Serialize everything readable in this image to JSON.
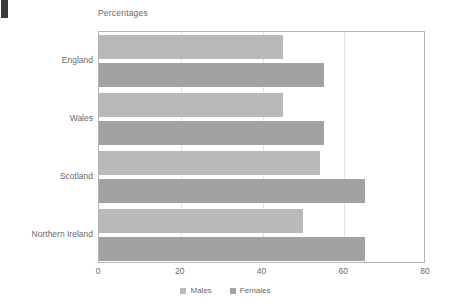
{
  "page": {
    "background": "#ffffff",
    "edge_mark_color": "#3a3a3a"
  },
  "chart_data": {
    "type": "bar",
    "orientation": "horizontal",
    "title": "Percentages",
    "xlabel": "",
    "ylabel": "",
    "xlim": [
      0,
      80
    ],
    "xticks": [
      0,
      20,
      40,
      60,
      80
    ],
    "grid": true,
    "grid_axis": "x",
    "legend_position": "bottom",
    "categories": [
      "England",
      "Wales",
      "Scotland",
      "Northern Ireland"
    ],
    "series": [
      {
        "name": "Males",
        "color": "#b9b9b9",
        "values": [
          45,
          45,
          54,
          50
        ]
      },
      {
        "name": "Females",
        "color": "#a2a2a2",
        "values": [
          55,
          55,
          65,
          65
        ]
      }
    ]
  },
  "axis": {
    "tick_labels": [
      "0",
      "20",
      "40",
      "60",
      "80"
    ]
  },
  "legend": {
    "items": [
      {
        "label": "Males",
        "color": "#b9b9b9"
      },
      {
        "label": "Females",
        "color": "#a2a2a2"
      }
    ]
  }
}
